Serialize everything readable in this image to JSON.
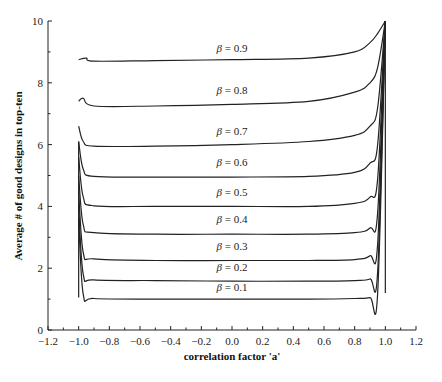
{
  "chart_data": {
    "type": "line",
    "title": "",
    "xlabel": "correlation factor 'a'",
    "ylabel": "Average # of good designs in top-ten",
    "xlim": [
      -1.2,
      1.2
    ],
    "ylim": [
      0,
      10
    ],
    "x_ticks": [
      "-1.2",
      "-1.0",
      "-0.8",
      "-0.6",
      "-0.4",
      "-0.2",
      "0.0",
      "0.2",
      "0.4",
      "0.6",
      "0.8",
      "1.0",
      "1.2"
    ],
    "y_ticks": [
      "0",
      "2",
      "4",
      "6",
      "8",
      "10"
    ],
    "grid": false,
    "legend": "inline labels",
    "series": [
      {
        "name": "β=0.9",
        "x": [
          -1.0,
          -0.95,
          -0.9,
          -0.5,
          0.0,
          0.5,
          0.8,
          0.9,
          0.95,
          1.0
        ],
        "values": [
          8.75,
          8.8,
          8.7,
          8.72,
          8.75,
          8.8,
          9.0,
          9.3,
          9.6,
          10.0
        ]
      },
      {
        "name": "β=0.8",
        "x": [
          -1.0,
          -0.97,
          -0.9,
          -0.5,
          0.0,
          0.5,
          0.8,
          0.9,
          0.95,
          1.0
        ],
        "values": [
          7.4,
          7.5,
          7.25,
          7.25,
          7.3,
          7.4,
          7.7,
          8.0,
          8.5,
          10.0
        ]
      },
      {
        "name": "β=0.7",
        "x": [
          -1.0,
          -0.97,
          -0.9,
          -0.5,
          0.0,
          0.5,
          0.8,
          0.9,
          0.95,
          1.0
        ],
        "values": [
          6.6,
          6.1,
          5.95,
          5.95,
          6.0,
          6.1,
          6.3,
          6.6,
          7.2,
          10.0
        ]
      },
      {
        "name": "β=0.6",
        "x": [
          -1.0,
          -0.97,
          -0.9,
          -0.5,
          0.0,
          0.5,
          0.8,
          0.9,
          0.95,
          1.0
        ],
        "values": [
          6.1,
          5.2,
          4.97,
          4.95,
          4.95,
          4.97,
          5.1,
          5.4,
          6.0,
          10.0
        ]
      },
      {
        "name": "β=0.5",
        "x": [
          -1.0,
          -0.97,
          -0.9,
          -0.5,
          0.0,
          0.5,
          0.8,
          0.9,
          0.95,
          1.0
        ],
        "values": [
          5.6,
          4.3,
          4.02,
          4.0,
          4.0,
          4.0,
          4.1,
          4.3,
          4.9,
          10.0
        ]
      },
      {
        "name": "β=0.4",
        "x": [
          -1.0,
          -0.97,
          -0.9,
          -0.5,
          0.0,
          0.5,
          0.8,
          0.9,
          0.95,
          1.0
        ],
        "values": [
          5.0,
          3.4,
          3.15,
          3.1,
          3.1,
          3.1,
          3.15,
          3.3,
          3.8,
          10.0
        ]
      },
      {
        "name": "β=0.3",
        "x": [
          -1.0,
          -0.97,
          -0.9,
          -0.5,
          0.0,
          0.5,
          0.8,
          0.9,
          0.95,
          1.0
        ],
        "values": [
          4.5,
          2.5,
          2.3,
          2.25,
          2.25,
          2.25,
          2.28,
          2.4,
          2.8,
          10.0
        ]
      },
      {
        "name": "β=0.2",
        "x": [
          -1.0,
          -0.97,
          -0.9,
          -0.5,
          0.0,
          0.5,
          0.8,
          0.9,
          0.95,
          1.0
        ],
        "values": [
          4.0,
          1.8,
          1.62,
          1.6,
          1.58,
          1.58,
          1.6,
          1.65,
          1.9,
          10.0
        ]
      },
      {
        "name": "β=0.1",
        "x": [
          -1.0,
          -0.97,
          -0.9,
          -0.5,
          0.0,
          0.5,
          0.8,
          0.9,
          0.95,
          1.0
        ],
        "values": [
          3.6,
          1.15,
          1.02,
          1.0,
          1.0,
          1.0,
          1.02,
          1.05,
          1.2,
          10.0
        ]
      }
    ],
    "curve_labels": [
      {
        "text": "β=0.9",
        "x": 0.0,
        "y": 9.0
      },
      {
        "text": "β=0.8",
        "x": 0.0,
        "y": 7.65
      },
      {
        "text": "β=0.7",
        "x": 0.0,
        "y": 6.3
      },
      {
        "text": "β=0.6",
        "x": 0.0,
        "y": 5.3
      },
      {
        "text": "β=0.5",
        "x": 0.0,
        "y": 4.35
      },
      {
        "text": "β=0.4",
        "x": 0.0,
        "y": 3.45
      },
      {
        "text": "β=0.3",
        "x": 0.0,
        "y": 2.6
      },
      {
        "text": "β=0.2",
        "x": 0.0,
        "y": 1.9
      },
      {
        "text": "β=0.1",
        "x": 0.0,
        "y": 1.25
      }
    ]
  }
}
